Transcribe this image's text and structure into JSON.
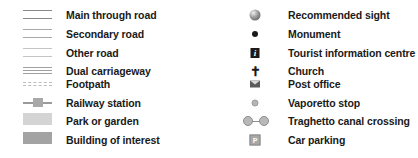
{
  "legend": {
    "left": [
      {
        "label": "Main through road",
        "symbol": "double-line-dark"
      },
      {
        "label": "Secondary road",
        "symbol": "double-line-medium"
      },
      {
        "label": "Other road",
        "symbol": "double-line-light"
      },
      {
        "label": "Dual carriageway",
        "symbol": "triple-line"
      },
      {
        "label": "Footpath",
        "symbol": "dashed-double-line"
      },
      {
        "label": "Railway station",
        "symbol": "line-with-station-block"
      },
      {
        "label": "Park or garden",
        "symbol": "light-grey-fill"
      },
      {
        "label": "Building of interest",
        "symbol": "dark-grey-fill"
      }
    ],
    "right": [
      {
        "label": "Recommended sight",
        "symbol": "shaded-sphere-icon"
      },
      {
        "label": "Monument",
        "symbol": "black-dot-icon"
      },
      {
        "label": "Tourist information centre",
        "symbol": "info-i-icon",
        "glyph": "i"
      },
      {
        "label": "Church",
        "symbol": "cross-icon",
        "glyph": "✝"
      },
      {
        "label": "Post office",
        "symbol": "envelope-icon"
      },
      {
        "label": "Vaporetto stop",
        "symbol": "small-circle-icon"
      },
      {
        "label": "Traghetto canal crossing",
        "symbol": "circle-dash-circle-icon"
      },
      {
        "label": "Car parking",
        "symbol": "parking-p-icon",
        "glyph": "P"
      }
    ]
  },
  "colors": {
    "text": "#1a1a1a",
    "park_fill": "#d4d4d4",
    "building_fill": "#a3a3a3",
    "background": "#ffffff"
  }
}
